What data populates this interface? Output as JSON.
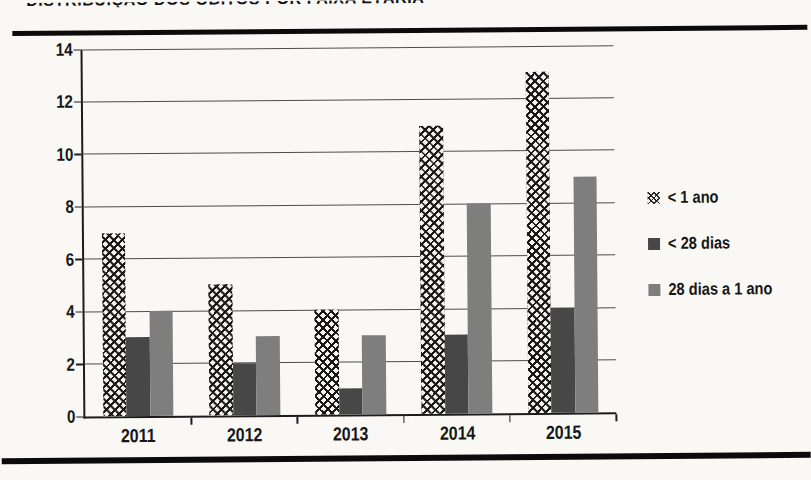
{
  "page": {
    "background": "#f9f8f5",
    "clipped_heading": "DISTRIBUIÇÃO DOS ÓBITOS POR FAIXA ETÁRIA",
    "rule_color": "#0b0b0b"
  },
  "chart_data": {
    "type": "bar",
    "title": "",
    "xlabel": "",
    "ylabel": "",
    "categories": [
      "2011",
      "2012",
      "2013",
      "2014",
      "2015"
    ],
    "series": [
      {
        "name": "< 1 ano",
        "values": [
          7,
          5,
          4,
          11,
          13
        ],
        "fill": "hatch",
        "color": "#181818"
      },
      {
        "name": "< 28 dias",
        "values": [
          3,
          2,
          1,
          3,
          4
        ],
        "fill": "solid",
        "color": "#474747"
      },
      {
        "name": "28 dias a 1 ano",
        "values": [
          4,
          3,
          3,
          8,
          9
        ],
        "fill": "solid",
        "color": "#7e7e7e"
      }
    ],
    "ylim": [
      0,
      14
    ],
    "ytick_step": 2,
    "grid": true,
    "gridline_color": "#4d4d4d",
    "axis_color": "#1c1c1c",
    "legend_position": "right"
  }
}
